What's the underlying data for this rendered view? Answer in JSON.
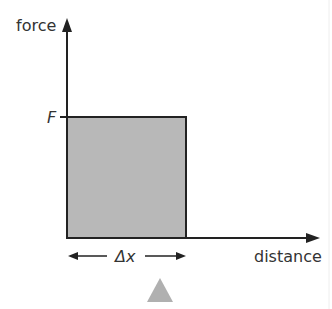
{
  "diagram": {
    "y_axis_label": "force",
    "x_axis_label": "distance",
    "force_level_label": "F",
    "width_label": "Δx",
    "fill_color": "#b8b8b8",
    "line_color": "#222222",
    "marker_color": "#b0b0b0"
  }
}
